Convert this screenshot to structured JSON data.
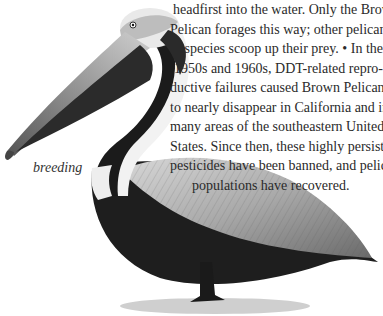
{
  "body_text": {
    "lines": [
      "headfirst into the water. Only the Brown",
      "Pelican forages this way; other pelican",
      "species scoop up their prey. • In the",
      "1950s and 1960s, DDT-related repro-",
      "ductive failures caused Brown Pelicans",
      "to nearly disappear in California and in",
      "many areas of the southeastern United",
      "States. Since then, these highly persistent",
      "pesticides have been banned, and pelican",
      "populations have recovered."
    ]
  },
  "illustration": {
    "subject": "Brown Pelican",
    "caption": "breeding"
  }
}
